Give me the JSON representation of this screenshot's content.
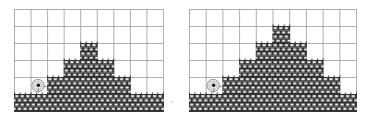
{
  "colors": {
    "grid_line": "#9a9a9a",
    "brick_outline": "#222222",
    "brick_fill": "#ffffff",
    "character_ring": "#9a9a9a",
    "character_fill": "#e6e6e6",
    "character_eye": "#111111"
  },
  "panels": [
    {
      "name": "left-level",
      "x": 14,
      "y": 9,
      "cols": 9,
      "rows": 6,
      "cell_w": 16.55,
      "cell_h": 17,
      "pyramid_rows": [
        {
          "row": 2,
          "from": 4,
          "to": 4
        },
        {
          "row": 3,
          "from": 3,
          "to": 5
        },
        {
          "row": 4,
          "from": 2,
          "to": 6
        },
        {
          "row": 5,
          "from": 0,
          "to": 8
        }
      ],
      "character": {
        "row": 4,
        "col": 1
      }
    },
    {
      "name": "right-level",
      "x": 189,
      "y": 9,
      "cols": 10,
      "rows": 6,
      "cell_w": 16.7,
      "cell_h": 17,
      "pyramid_rows": [
        {
          "row": 1,
          "from": 5,
          "to": 5
        },
        {
          "row": 2,
          "from": 4,
          "to": 6
        },
        {
          "row": 3,
          "from": 3,
          "to": 7
        },
        {
          "row": 4,
          "from": 2,
          "to": 8
        },
        {
          "row": 5,
          "from": 0,
          "to": 9
        }
      ],
      "character": {
        "row": 4,
        "col": 1
      }
    }
  ]
}
